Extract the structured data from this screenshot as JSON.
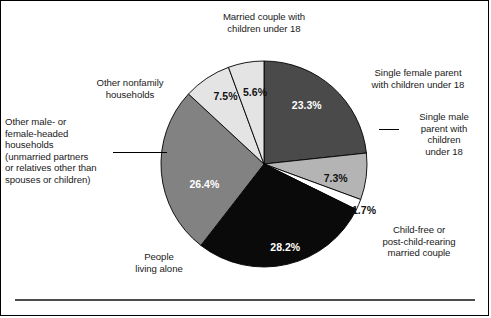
{
  "figure": {
    "title": "",
    "background_color": "#ffffff",
    "border_color": "#000000",
    "rule_color": "#4d4d4d"
  },
  "labels": {
    "married_couple": "Married couple with\nchildren under 18",
    "single_female_parent": "Single female parent\nwith children under 18",
    "single_male_parent": "Single male\nparent with\nchildren\nunder 18",
    "other_nonfamily": "Other nonfamily\nhouseholds",
    "other_male_female_headed": "Other male- or\nfemale-headed\nhouseholds\n(unmarried partners\nor relatives other than\nspouses or children)",
    "people_living_alone": "People\nliving alone",
    "child_free": "Child-free or\npost-child-rearing\nmarried couple"
  },
  "percent_labels": {
    "married_couple": "23.3%",
    "single_female_parent": "7.3%",
    "single_male_parent": "1.7%",
    "child_free": "28.2%",
    "people_living_alone": "26.4%",
    "other_male_female_headed": "7.5%",
    "other_nonfamily": "5.6%"
  },
  "chart_data": {
    "type": "pie",
    "title": "",
    "categories": [
      "Married couple with children under 18",
      "Single female parent with children under 18",
      "Single male parent with children under 18",
      "Child-free or post-child-rearing married couple",
      "People living alone",
      "Other male- or female-headed households (unmarried partners or relatives other than spouses or children)",
      "Other nonfamily households"
    ],
    "values": [
      23.3,
      7.3,
      1.7,
      28.2,
      26.4,
      7.5,
      5.6
    ],
    "value_labels": [
      "23.3%",
      "7.3%",
      "1.7%",
      "28.2%",
      "26.4%",
      "7.5%",
      "5.6%"
    ],
    "colors": [
      "#4a4a4a",
      "#b4b4b4",
      "#ffffff",
      "#0a0a0a",
      "#828282",
      "#e4e4e4",
      "#e4e4e4"
    ],
    "label_text_colors": [
      "#ffffff",
      "#111111",
      "#111111",
      "#ffffff",
      "#ffffff",
      "#111111",
      "#111111"
    ],
    "start_angle_deg": 0,
    "direction": "clockwise",
    "total": 100.0,
    "units": "percent",
    "legend": "none",
    "grid": false,
    "slice_border_color": "#000000",
    "center": {
      "x": 263,
      "y": 163
    },
    "radius": 103
  }
}
